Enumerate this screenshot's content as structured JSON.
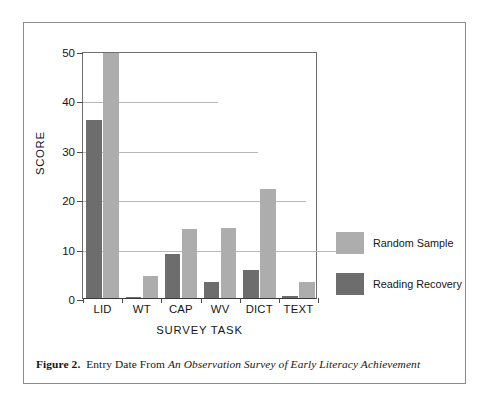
{
  "figure": {
    "caption_label": "Figure 2.",
    "caption_text": "Entry Date From ",
    "caption_italic": "An Observation Survey of Early Literacy Achievement"
  },
  "colors": {
    "random_sample": "#adadad",
    "reading_recovery": "#6d6d6d",
    "gridline": "#b9b9b9",
    "axis": "#4a4a4a",
    "frame": "#8d8d8d"
  },
  "chart_data": {
    "type": "bar",
    "title": "",
    "xlabel": "SURVEY TASK",
    "ylabel": "SCORE",
    "categories": [
      "LID",
      "WT",
      "CAP",
      "WV",
      "DICT",
      "TEXT"
    ],
    "series": [
      {
        "name": "Random Sample",
        "color": "#adadad",
        "values": [
          49.5,
          4.5,
          14.0,
          14.2,
          22.0,
          3.3
        ]
      },
      {
        "name": "Reading Recovery",
        "color": "#6d6d6d",
        "values": [
          36.0,
          0.2,
          9.0,
          3.3,
          5.7,
          0.5
        ]
      }
    ],
    "ylim": [
      0,
      50
    ],
    "yticks": [
      0,
      10,
      20,
      30,
      40,
      50
    ],
    "ytick_labels": [
      "0",
      "10",
      "20",
      "30",
      "40",
      "50"
    ],
    "grid": true,
    "gridline_extent_px": [
      270,
      223,
      175,
      135,
      0
    ],
    "legend_position": "right",
    "bar_order": "reading-recovery-left"
  }
}
